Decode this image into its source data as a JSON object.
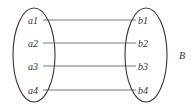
{
  "diagram": {
    "set_a": {
      "elements": [
        "a1",
        "a2",
        "a3",
        "a4"
      ]
    },
    "set_b": {
      "label": "B",
      "elements": [
        "b1",
        "b2",
        "b3",
        "b4"
      ]
    },
    "mappings": [
      {
        "from": "a1",
        "to": "b1"
      },
      {
        "from": "a2",
        "to": "b2"
      },
      {
        "from": "a3",
        "to": "b3"
      },
      {
        "from": "a4",
        "to": "b4"
      }
    ],
    "colors": {
      "stroke": "#333333",
      "line": "#555555"
    }
  }
}
